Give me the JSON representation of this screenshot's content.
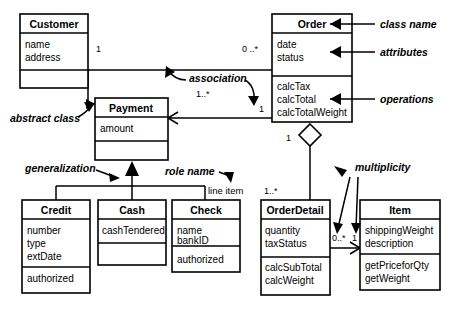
{
  "diagram": {
    "classes": [
      {
        "id": "customer",
        "name": "Customer",
        "attributes": [
          "name",
          "address"
        ],
        "operations": []
      },
      {
        "id": "order",
        "name": "Order",
        "attributes": [
          "date",
          "status"
        ],
        "operations": [
          "calcTax",
          "calcTotal",
          "calcTotalWeight"
        ]
      },
      {
        "id": "payment",
        "name": "Payment",
        "attributes": [
          "amount"
        ],
        "operations": []
      },
      {
        "id": "credit",
        "name": "Credit",
        "attributes": [
          "number",
          "type",
          "extDate"
        ],
        "operations": [
          "authorized"
        ]
      },
      {
        "id": "cash",
        "name": "Cash",
        "attributes": [
          "cashTendered"
        ],
        "operations": []
      },
      {
        "id": "check",
        "name": "Check",
        "attributes": [
          "name",
          "bankID"
        ],
        "operations": [
          "authorized"
        ]
      },
      {
        "id": "orderdetail",
        "name": "OrderDetail",
        "attributes": [
          "quantity",
          "taxStatus"
        ],
        "operations": [
          "calcSubTotal",
          "calcWeight"
        ]
      },
      {
        "id": "item",
        "name": "Item",
        "attributes": [
          "shippingWeight",
          "description"
        ],
        "operations": [
          "getPriceforQty",
          "getWeight"
        ]
      }
    ],
    "multiplicities": {
      "customer_to_order": "1",
      "order_to_customer": "0 ..*",
      "payment_to_customer": "1..*",
      "order_to_payment": "1",
      "order_aggregation": "1",
      "orderdetail_to_order": "1..*",
      "orderdetail_to_item": "0..*",
      "item_to_orderdetail": "1"
    },
    "roles": {
      "line_item": "line item"
    },
    "annotations": {
      "class_name": "class name",
      "attributes": "attributes",
      "operations": "operations",
      "association": "association",
      "abstract_class": "abstract class",
      "generalization": "generalization",
      "role_name": "role name",
      "multiplicity": "multiplicity"
    },
    "colors": {
      "stroke": "#000000",
      "fill": "#ffffff",
      "background": "#ffffff"
    }
  }
}
